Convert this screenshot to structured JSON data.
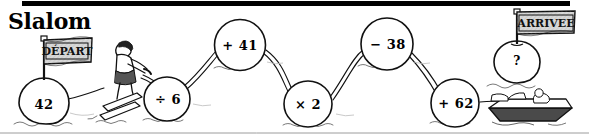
{
  "page": {
    "title": "Slalom",
    "language": "fr"
  },
  "decor": {
    "top_rule": "horizontal-black-bar"
  },
  "flags": [
    {
      "name": "start-flag",
      "label": "DÉPART",
      "x": 60,
      "y": 51
    },
    {
      "name": "finish-flag",
      "label": "ARRIVEE",
      "x": 533,
      "y": 22
    }
  ],
  "buoys": [
    {
      "name": "buoy-start",
      "label": "42",
      "x": 44,
      "y": 103,
      "rx": 25,
      "ry": 25
    },
    {
      "name": "buoy-divide",
      "label": "÷ 6",
      "x": 167,
      "y": 99,
      "rx": 23,
      "ry": 22
    },
    {
      "name": "buoy-add-41",
      "label": "+ 41",
      "x": 240,
      "y": 45,
      "rx": 26,
      "ry": 25
    },
    {
      "name": "buoy-times-2",
      "label": "× 2",
      "x": 308,
      "y": 104,
      "rx": 24,
      "ry": 23
    },
    {
      "name": "buoy-minus-38",
      "label": "− 38",
      "x": 387,
      "y": 44,
      "rx": 27,
      "ry": 25
    },
    {
      "name": "buoy-add-62",
      "label": "+ 62",
      "x": 455,
      "y": 103,
      "rx": 25,
      "ry": 23
    },
    {
      "name": "buoy-answer",
      "label": "?",
      "x": 517,
      "y": 62,
      "rx": 23,
      "ry": 21
    }
  ],
  "figures": [
    {
      "name": "water-skier",
      "description": "water-skier-figure"
    },
    {
      "name": "motorboat",
      "description": "motorboat-with-driver"
    }
  ],
  "chain": {
    "description": "tow-rope connecting buoys in slalom order",
    "order": [
      "42",
      "÷ 6",
      "+ 41",
      "× 2",
      "− 38",
      "+ 62",
      "?"
    ]
  },
  "colors": {
    "ink": "#111111",
    "paper": "#ffffff",
    "flag_fill": "#d8d8d8",
    "shade": "#cfcfcf"
  }
}
